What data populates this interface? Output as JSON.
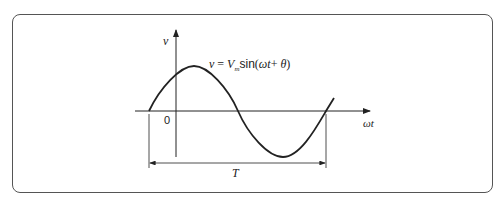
{
  "diagram": {
    "type": "sine-waveform",
    "y_axis_label": "v",
    "x_axis_label": "ωt",
    "origin_label": "0",
    "period_label": "T",
    "equation": {
      "lhs": "v",
      "eq": " = ",
      "amp": "V",
      "amp_sub": "m",
      "fn": "sin",
      "arg_open": "(",
      "arg": "ωt",
      "plus": "+ ",
      "phase": "θ",
      "arg_close": ")"
    },
    "colors": {
      "line": "#222222",
      "frame": "#555555"
    }
  }
}
